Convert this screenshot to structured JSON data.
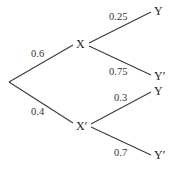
{
  "diagram": {
    "type": "probability-tree",
    "root": {
      "children": [
        {
          "label": "X",
          "probability": "0.6",
          "children": [
            {
              "label": "Y",
              "probability": "0.25"
            },
            {
              "label": "Y′",
              "probability": "0.75"
            }
          ]
        },
        {
          "label": "X′",
          "probability": "0.4",
          "children": [
            {
              "label": "Y",
              "probability": "0.3"
            },
            {
              "label": "Y′",
              "probability": "0.7"
            }
          ]
        }
      ]
    }
  }
}
